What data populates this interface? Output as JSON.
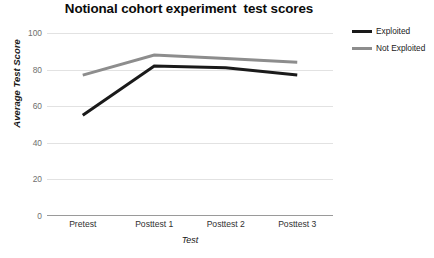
{
  "chart_data": {
    "type": "line",
    "title": "Notional cohort experiment  test scores",
    "xlabel": "Test",
    "ylabel": "Average Test Score",
    "categories": [
      "Pretest",
      "Posttest 1",
      "Posttest 2",
      "Posttest 3"
    ],
    "ylim": [
      0,
      100
    ],
    "yticks": [
      0,
      20,
      40,
      60,
      80,
      100
    ],
    "ytick_labels": [
      "0",
      "20",
      "40",
      "60",
      "80",
      "100"
    ],
    "grid": "horizontal",
    "legend_position": "top-right",
    "series": [
      {
        "name": "Exploited",
        "color": "#1a1a1a",
        "width": 3,
        "values": [
          55,
          82,
          81,
          77
        ]
      },
      {
        "name": "Not Exploited",
        "color": "#8d8d8d",
        "width": 3,
        "values": [
          77,
          88,
          86,
          84
        ]
      }
    ]
  },
  "colors": {
    "gridline": "#e2e2e2",
    "axis": "#9a9a9a",
    "tick_text": "#6f6f6f",
    "background": "#ffffff"
  }
}
